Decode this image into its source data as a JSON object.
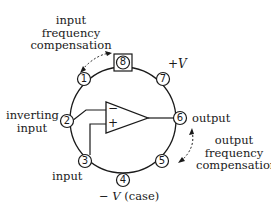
{
  "diagram": {
    "pins": [
      {
        "number": "1",
        "label": ""
      },
      {
        "number": "2",
        "label": "inverting input"
      },
      {
        "number": "3",
        "label": "input"
      },
      {
        "number": "4",
        "label": "−V (case)"
      },
      {
        "number": "5",
        "label": ""
      },
      {
        "number": "6",
        "label": "output"
      },
      {
        "number": "7",
        "label": "+V"
      },
      {
        "number": "8",
        "label": ""
      }
    ],
    "labels": {
      "input_freq_comp_1": "input",
      "input_freq_comp_2": "frequency",
      "input_freq_comp_3": "compensation",
      "plus_v": "+V",
      "inverting_1": "inverting",
      "inverting_2": "input",
      "noninverting": "input",
      "minus_v_sign": "− ",
      "minus_v_v": "V",
      "minus_v_case": " (case)",
      "output": "output",
      "output_freq_comp_1": "output",
      "output_freq_comp_2": "frequency",
      "output_freq_comp_3": "compensation"
    },
    "opamp": {
      "minus": "−",
      "plus": "+"
    }
  }
}
